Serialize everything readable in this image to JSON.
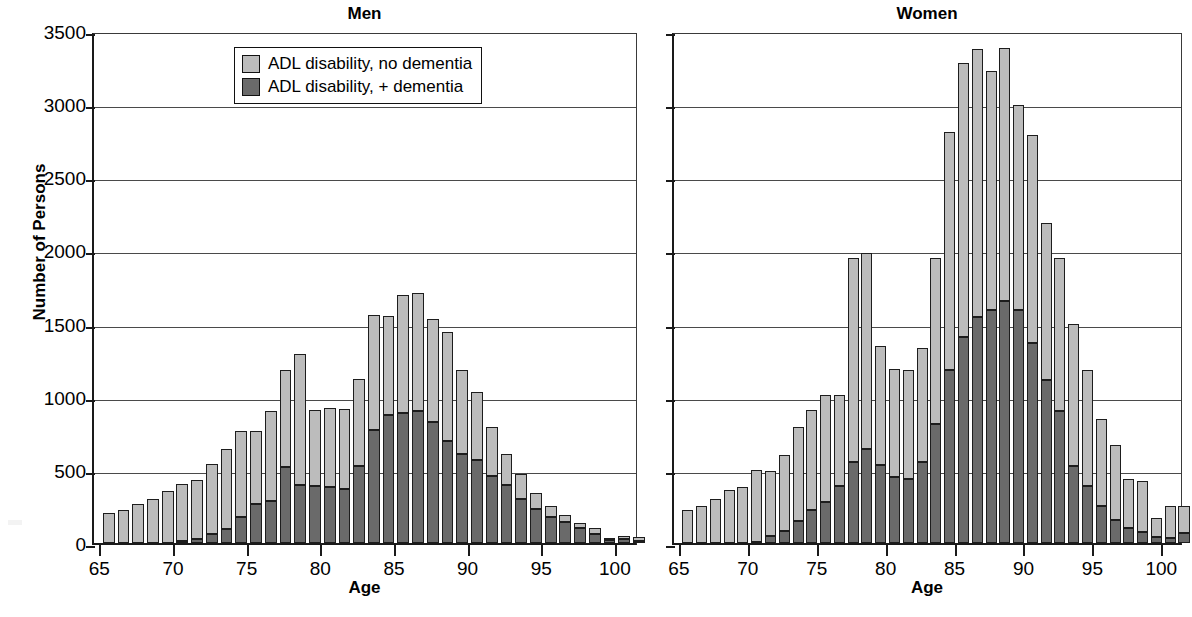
{
  "axis": {
    "y_title": "Number of Persons",
    "x_title": "Age",
    "y_ticks": [
      0,
      500,
      1000,
      1500,
      2000,
      2500,
      3000,
      3500
    ],
    "y_tick_labels": [
      "0",
      "500",
      "1000",
      "1500",
      "2000",
      "2500",
      "3000",
      "3500"
    ],
    "x_ticks": [
      65,
      70,
      75,
      80,
      85,
      90,
      95,
      100
    ],
    "x_tick_labels": [
      "65",
      "70",
      "75",
      "80",
      "85",
      "90",
      "95",
      "100"
    ]
  },
  "legend": {
    "items": [
      {
        "label": "ADL disability, no dementia",
        "color": "#bcbcbc",
        "swatch": "light-swatch"
      },
      {
        "label": "ADL disability, + dementia",
        "color": "#6a6a6a",
        "swatch": "dark-swatch"
      }
    ]
  },
  "panels": [
    {
      "id": "men",
      "title": "Men"
    },
    {
      "id": "women",
      "title": "Women"
    }
  ],
  "colors": {
    "no_dementia": "#bcbcbc",
    "plus_dementia": "#6a6a6a",
    "axis": "#1a1a1a",
    "grid": "#4a4a4a",
    "background": "#ffffff"
  },
  "chart_data": {
    "type": "bar",
    "subtype": "stacked-histogram",
    "title": "",
    "panels": [
      "Men",
      "Women"
    ],
    "xlabel": "Age",
    "ylabel": "Number of Persons",
    "ylim": [
      0,
      3500
    ],
    "xlim": [
      64.5,
      101.5
    ],
    "ytick_interval": 500,
    "grid": "horizontal",
    "legend_position": "top-left of Men panel",
    "x": [
      65,
      66,
      67,
      68,
      69,
      70,
      71,
      72,
      73,
      74,
      75,
      76,
      77,
      78,
      79,
      80,
      81,
      82,
      83,
      84,
      85,
      86,
      87,
      88,
      89,
      90,
      91,
      92,
      93,
      94,
      95,
      96,
      97,
      98,
      99,
      100,
      101
    ],
    "charts": [
      {
        "panel": "Men",
        "title": "Men",
        "categories": [
          65,
          66,
          67,
          68,
          69,
          70,
          71,
          72,
          73,
          74,
          75,
          76,
          77,
          78,
          79,
          80,
          81,
          82,
          83,
          84,
          85,
          86,
          87,
          88,
          89,
          90,
          91,
          92,
          93,
          94,
          95,
          96,
          97,
          98,
          99,
          100,
          101
        ],
        "series": [
          {
            "name": "ADL disability, + dementia",
            "color": "#6a6a6a",
            "values": [
              0,
              0,
              0,
              0,
              0,
              15,
              30,
              60,
              95,
              175,
              265,
              290,
              520,
              400,
              390,
              385,
              370,
              525,
              775,
              875,
              890,
              905,
              825,
              700,
              610,
              565,
              460,
              395,
              300,
              235,
              180,
              145,
              100,
              60,
              20,
              25,
              15
            ]
          },
          {
            "name": "ADL disability, no dementia",
            "color": "#bcbcbc",
            "values": [
              205,
              225,
              265,
              300,
              355,
              390,
              400,
              480,
              545,
              590,
              500,
              610,
              665,
              890,
              520,
              535,
              545,
              595,
              785,
              680,
              805,
              805,
              705,
              740,
              570,
              465,
              330,
              215,
              175,
              110,
              70,
              45,
              35,
              40,
              10,
              20,
              25
            ]
          }
        ],
        "totals": [
          205,
          225,
          265,
          300,
          355,
          405,
          430,
          540,
          640,
          765,
          765,
          900,
          1185,
          1290,
          910,
          920,
          915,
          1120,
          1560,
          1555,
          1695,
          1710,
          1530,
          1440,
          1180,
          1030,
          790,
          610,
          475,
          345,
          250,
          190,
          135,
          100,
          30,
          45,
          40
        ]
      },
      {
        "panel": "Women",
        "title": "Women",
        "categories": [
          65,
          66,
          67,
          68,
          69,
          70,
          71,
          72,
          73,
          74,
          75,
          76,
          77,
          78,
          79,
          80,
          81,
          82,
          83,
          84,
          85,
          86,
          87,
          88,
          89,
          90,
          91,
          92,
          93,
          94,
          95,
          96,
          97,
          98,
          99,
          100,
          101
        ],
        "series": [
          {
            "name": "ADL disability, + dementia",
            "color": "#6a6a6a",
            "values": [
              0,
              0,
              0,
              0,
              0,
              10,
              45,
              85,
              150,
              225,
              280,
              390,
              555,
              645,
              535,
              450,
              440,
              555,
              815,
              1180,
              1405,
              1545,
              1590,
              1655,
              1590,
              1370,
              1115,
              905,
              525,
              390,
              250,
              160,
              105,
              75,
              40,
              35,
              70
            ]
          },
          {
            "name": "ADL disability, no dementia",
            "color": "#bcbcbc",
            "values": [
              225,
              250,
              300,
              365,
              385,
              490,
              450,
              515,
              640,
              685,
              735,
              625,
              1395,
              1335,
              815,
              740,
              745,
              775,
              1130,
              1630,
              1875,
              1830,
              1640,
              1730,
              1405,
              1420,
              1075,
              1045,
              970,
              795,
              600,
              510,
              335,
              350,
              130,
              220,
              185
            ]
          }
        ],
        "totals": [
          225,
          250,
          300,
          365,
          385,
          500,
          495,
          600,
          790,
          910,
          1015,
          1015,
          1950,
          1980,
          1350,
          1190,
          1185,
          1330,
          1945,
          2810,
          3280,
          3375,
          3230,
          3385,
          2995,
          2790,
          2190,
          1950,
          1495,
          1185,
          850,
          670,
          440,
          425,
          170,
          255,
          255
        ]
      }
    ]
  }
}
